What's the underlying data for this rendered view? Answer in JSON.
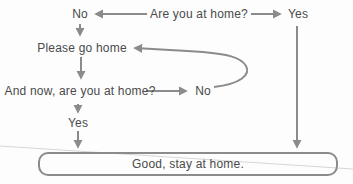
{
  "diagram": {
    "nodes": {
      "question1": "Are you at home?",
      "no1": "No",
      "yes1": "Yes",
      "action": "Please go home",
      "question2": "And now, are you at home?",
      "no2": "No",
      "yes2": "Yes",
      "terminal": "Good, stay at home."
    },
    "edges": [
      {
        "from": "question1",
        "to": "no1",
        "direction": "left"
      },
      {
        "from": "question1",
        "to": "yes1",
        "direction": "right"
      },
      {
        "from": "no1",
        "to": "action",
        "direction": "down"
      },
      {
        "from": "action",
        "to": "question2",
        "direction": "down"
      },
      {
        "from": "question2",
        "to": "no2",
        "direction": "right"
      },
      {
        "from": "no2",
        "to": "action",
        "direction": "curved-loop-back"
      },
      {
        "from": "question2",
        "to": "yes2",
        "direction": "down"
      },
      {
        "from": "yes2",
        "to": "terminal",
        "direction": "down"
      },
      {
        "from": "yes1",
        "to": "terminal",
        "direction": "down-long"
      }
    ],
    "colors": {
      "arrow": "#8b8b8b",
      "text": "#4a4a4a",
      "box_border": "#8b8b8b",
      "background": "#fdfdfd",
      "artifact_line": "#d6d6d6"
    }
  }
}
